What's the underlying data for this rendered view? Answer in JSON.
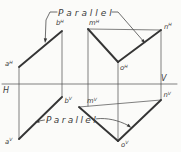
{
  "figure": {
    "colors": {
      "ink": "#3d3d3d",
      "background": "#fbfbf9"
    },
    "annotations": {
      "parallel_top": "Parallel",
      "parallel_bottom": "Parallel"
    },
    "planes": {
      "horizontal": "H",
      "vertical": "V"
    },
    "points": {
      "aH": {
        "base": "a",
        "sup": "H"
      },
      "bH": {
        "base": "b",
        "sup": "H"
      },
      "mH": {
        "base": "m",
        "sup": "H"
      },
      "nH": {
        "base": "n",
        "sup": "H"
      },
      "oH": {
        "base": "o",
        "sup": "H"
      },
      "aV": {
        "base": "a",
        "sup": "V"
      },
      "bV": {
        "base": "b",
        "sup": "V"
      },
      "mV": {
        "base": "m",
        "sup": "V"
      },
      "nV": {
        "base": "n",
        "sup": "V"
      },
      "oV": {
        "base": "o",
        "sup": "V"
      }
    }
  }
}
